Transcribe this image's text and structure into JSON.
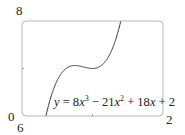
{
  "chart_data": {
    "type": "line",
    "title": "",
    "equation": "y = 8x^3 - 21x^2 + 18x + 2",
    "xlabel": "",
    "ylabel": "",
    "xlim": [
      0,
      2
    ],
    "ylim": [
      6,
      8
    ],
    "grid": false,
    "tick_labels": {
      "y_top": "8",
      "x_left": "0",
      "y_bottom": "6",
      "x_right": "2"
    },
    "series": [
      {
        "name": "y = 8x^3 - 21x^2 + 18x + 2",
        "x": [
          0.31,
          0.4,
          0.5,
          0.6,
          0.7,
          0.75,
          0.8,
          0.9,
          1.0,
          1.1,
          1.2,
          1.27
        ],
        "values": [
          6.0,
          6.59,
          6.75,
          6.97,
          7.05,
          7.06,
          7.06,
          7.02,
          7.0,
          7.04,
          7.26,
          8.0
        ]
      }
    ]
  },
  "labels": {
    "y_max": "8",
    "x_min": "0",
    "y_min": "6",
    "x_max": "2"
  },
  "equation": {
    "lhs": "y",
    "eq": " = 8",
    "x1": "x",
    "p1": "3",
    "t2": " − 21",
    "x2": "x",
    "p2": "2",
    "t3": " + 18",
    "x3": "x",
    "t4": " + 2"
  }
}
